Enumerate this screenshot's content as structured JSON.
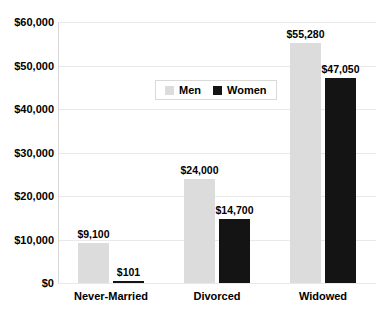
{
  "chart_data": {
    "type": "bar",
    "title": "",
    "xlabel": "",
    "ylabel": "",
    "categories": [
      "Never-Married",
      "Divorced",
      "Widowed"
    ],
    "series": [
      {
        "name": "Men",
        "color": "#dcdcdc",
        "values": [
          9100,
          24000,
          55280
        ],
        "value_labels": [
          "$9,100",
          "$24,000",
          "$55,280"
        ]
      },
      {
        "name": "Women",
        "color": "#141414",
        "values": [
          101,
          14700,
          47050
        ],
        "value_labels": [
          "$101",
          "$14,700",
          "$47,050"
        ]
      }
    ],
    "ylim": [
      0,
      60000
    ],
    "ytick_step": 10000,
    "ytick_labels": [
      "$0",
      "$10,000",
      "$20,000",
      "$30,000",
      "$40,000",
      "$50,000",
      "$60,000"
    ],
    "grid": true,
    "legend": {
      "position": "inside-top-center",
      "entries": [
        "Men",
        "Women"
      ]
    },
    "colors": {
      "gridline": "#e9e9e9",
      "axis_line": "#d6d6d6",
      "text": "#000000",
      "background": "#ffffff"
    }
  }
}
